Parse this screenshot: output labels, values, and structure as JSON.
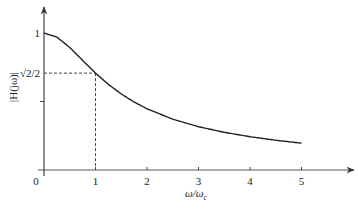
{
  "chart_data": {
    "type": "line",
    "title": "",
    "xlabel": "ω/ωc",
    "ylabel": "|H(jω)|",
    "xlim": [
      0,
      5.9
    ],
    "ylim": [
      0,
      1.2
    ],
    "grid": false,
    "legend": null,
    "x_ticks": [
      {
        "value": 0,
        "label": "0"
      },
      {
        "value": 1,
        "label": "1"
      },
      {
        "value": 2,
        "label": "2"
      },
      {
        "value": 3,
        "label": "3"
      },
      {
        "value": 4,
        "label": "4"
      },
      {
        "value": 5,
        "label": "5"
      }
    ],
    "y_ticks": [
      {
        "value": 1,
        "label": "1"
      },
      {
        "value": 0.7071,
        "label": "√2/2"
      },
      {
        "value": 0.5,
        "label": ""
      }
    ],
    "series": [
      {
        "name": "|H(jω)| = 1/√(1+(ω/ωc)²)",
        "x": [
          0,
          0.25,
          0.5,
          0.75,
          1,
          1.25,
          1.5,
          1.75,
          2,
          2.5,
          3,
          3.5,
          4,
          4.5,
          5
        ],
        "values": [
          1.0,
          0.97,
          0.894,
          0.8,
          0.707,
          0.625,
          0.555,
          0.496,
          0.447,
          0.371,
          0.316,
          0.275,
          0.243,
          0.217,
          0.196
        ]
      }
    ],
    "annotations": [
      {
        "type": "dashed-guide",
        "x": 1,
        "y": 0.7071,
        "description": "Dashed lines from (1, √2/2) to both axes marking the cutoff point"
      }
    ]
  }
}
